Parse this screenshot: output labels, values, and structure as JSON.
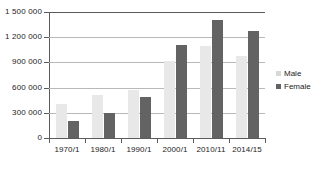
{
  "chart_data": {
    "type": "bar",
    "title": "",
    "subtitle": "",
    "xlabel": "",
    "ylabel": "",
    "categories": [
      "1970/1",
      "1980/1",
      "1990/1",
      "2000/1",
      "2010/11",
      "2014/15"
    ],
    "series": [
      {
        "name": "Male",
        "color": "#e8e8e8",
        "values": [
          400000,
          510000,
          570000,
          920000,
          1090000,
          980000
        ]
      },
      {
        "name": "Female",
        "color": "#636363",
        "values": [
          200000,
          295000,
          485000,
          1110000,
          1400000,
          1270000
        ]
      }
    ],
    "ylim": [
      0,
      1500000
    ],
    "y_ticks": [
      0,
      300000,
      600000,
      900000,
      1200000,
      1500000
    ],
    "y_tick_labels": [
      "0",
      "300 000",
      "600 000",
      "900 000",
      "1 200 000",
      "1 500 000"
    ],
    "grid": true,
    "grid_axis": "y",
    "legend_position": "right",
    "legend_entries": [
      "Male",
      "Female"
    ]
  }
}
